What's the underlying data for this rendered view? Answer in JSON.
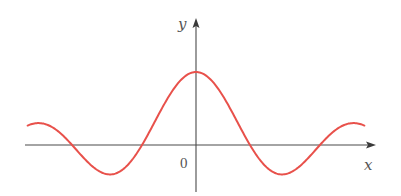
{
  "chart_data": {
    "type": "line",
    "title": "",
    "xlabel": "x",
    "ylabel": "y",
    "origin_label": "0",
    "function": "J0(x) (Bessel function of the first kind, order 0) — damped oscillation with maximum at origin",
    "xlim": [
      -7.5,
      7.5
    ],
    "ylim": [
      -0.45,
      1.1
    ],
    "grid": false,
    "legend": null,
    "series": [
      {
        "name": "curve",
        "color": "#e8514b",
        "x": [
          -7.5,
          -7.0,
          -6.5,
          -6.0,
          -5.5,
          -5.0,
          -4.5,
          -4.0,
          -3.5,
          -3.0,
          -2.5,
          -2.0,
          -1.5,
          -1.0,
          -0.5,
          0.0,
          0.5,
          1.0,
          1.5,
          2.0,
          2.5,
          3.0,
          3.5,
          4.0,
          4.5,
          5.0,
          5.5,
          6.0,
          6.5,
          7.0,
          7.5
        ],
        "y": [
          0.266,
          0.3,
          0.26,
          0.151,
          -0.007,
          -0.178,
          -0.321,
          -0.397,
          -0.38,
          -0.26,
          -0.048,
          0.224,
          0.512,
          0.765,
          0.938,
          1.0,
          0.938,
          0.765,
          0.512,
          0.224,
          -0.048,
          -0.26,
          -0.38,
          -0.397,
          -0.321,
          -0.178,
          -0.007,
          0.151,
          0.26,
          0.3,
          0.266
        ]
      }
    ],
    "annotations": {
      "zeros_approx": [
        -5.52,
        -2.405,
        2.405,
        5.52
      ],
      "maximum": [
        0,
        1
      ],
      "minima_approx": [
        [
          -3.83,
          -0.403
        ],
        [
          3.83,
          -0.403
        ]
      ],
      "side_maxima_approx": [
        [
          -7.02,
          0.3
        ],
        [
          7.02,
          0.3
        ]
      ]
    },
    "colors": {
      "curve": "#e8514b",
      "axes": "#4a4a4a",
      "labels": "#555555"
    }
  },
  "layout": {
    "origin_px": [
      196,
      145
    ],
    "px_per_unit_x": 22.45,
    "px_per_unit_y": 73,
    "x_axis": {
      "x1": 25,
      "x2": 376
    },
    "y_axis": {
      "y1": 192,
      "y2": 18
    }
  }
}
